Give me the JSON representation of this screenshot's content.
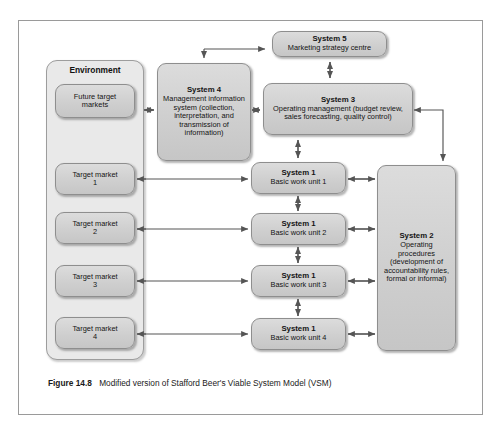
{
  "figure": {
    "caption_label": "Figure 14.8",
    "caption_text": "Modified version of Stafford Beer's Viable System Model (VSM)",
    "frame_color": "#9a9a9a",
    "node_fill": "#cfcfcf",
    "container_fill": "#e9e9e9"
  },
  "environment": {
    "title": "Environment",
    "markets": [
      {
        "line1": "Future target",
        "line2": "markets"
      },
      {
        "line1": "Target market",
        "line2": "1"
      },
      {
        "line1": "Target market",
        "line2": "2"
      },
      {
        "line1": "Target market",
        "line2": "3"
      },
      {
        "line1": "Target market",
        "line2": "4"
      }
    ]
  },
  "systems": {
    "system5": {
      "title": "System 5",
      "subtitle": "Marketing strategy centre"
    },
    "system4": {
      "title": "System 4",
      "subtitle": "Management information system (collection, interpretation, and transmission of information)"
    },
    "system3": {
      "title": "System 3",
      "subtitle": "Operating management (budget review, sales forecasting, quality control)"
    },
    "system2": {
      "title": "System 2",
      "subtitle": "Operating procedures (development of accountability rules, formal or informal)"
    },
    "system1": [
      {
        "title": "System 1",
        "subtitle": "Basic work unit 1"
      },
      {
        "title": "System 1",
        "subtitle": "Basic work unit 2"
      },
      {
        "title": "System 1",
        "subtitle": "Basic work unit 3"
      },
      {
        "title": "System 1",
        "subtitle": "Basic work unit 4"
      }
    ]
  }
}
